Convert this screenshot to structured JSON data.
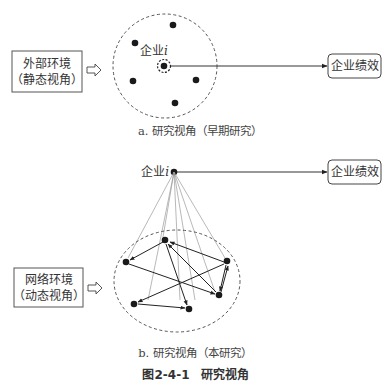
{
  "figure": {
    "title": "图2-4-1　研究视角",
    "panel_a": {
      "caption": "a. 研究视角（早期研究）",
      "environment_box": {
        "line1": "外部环境",
        "line2": "（静态视角）"
      },
      "firm_label": "企业",
      "firm_index": "i",
      "outcome_box": "企业绩效",
      "peer_nodes": [
        {
          "x": 173,
          "y": 25
        },
        {
          "x": 135,
          "y": 43
        },
        {
          "x": 133,
          "y": 81
        },
        {
          "x": 196,
          "y": 80
        },
        {
          "x": 175,
          "y": 103
        }
      ]
    },
    "panel_b": {
      "caption": "b. 研究视角（本研究）",
      "environment_box": {
        "line1": "网络环境",
        "line2": "（动态视角）"
      },
      "firm_label": "企业",
      "firm_index": "i",
      "outcome_box": "企业绩效",
      "network_nodes": [
        {
          "id": "n1",
          "x": 165,
          "y": 240
        },
        {
          "id": "n2",
          "x": 126,
          "y": 262
        },
        {
          "id": "n3",
          "x": 227,
          "y": 261
        },
        {
          "id": "n4",
          "x": 219,
          "y": 295
        },
        {
          "id": "n5",
          "x": 134,
          "y": 304
        },
        {
          "id": "n6",
          "x": 189,
          "y": 309
        }
      ]
    }
  },
  "colors": {
    "line": "#333333",
    "node": "#1a1a1a",
    "dashed": "#555555",
    "thin": "#888888"
  }
}
